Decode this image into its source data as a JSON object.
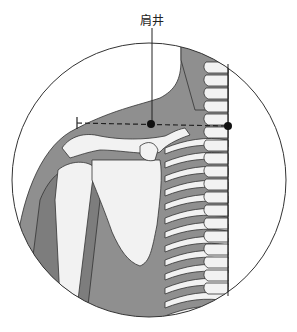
{
  "figure": {
    "acupoint_label": "肩井",
    "colors": {
      "skin": "#8f8f8f",
      "skin_dark": "#7a7a7a",
      "bone": "#f2f2f2",
      "bone_shadow": "#b9b9b9",
      "outline": "#333333",
      "marker": "#111111",
      "background": "#ffffff"
    }
  }
}
